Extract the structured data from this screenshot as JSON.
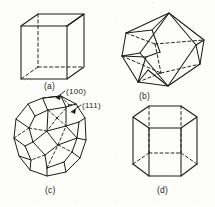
{
  "figure": {
    "background_color": "#fdfdfb",
    "line_color": "#1b1b1b",
    "style": "scanned textbook line art, solid visible edges, dashed hidden edges"
  },
  "captions": {
    "a": "(a)",
    "b": "(b)",
    "c": "(c)",
    "d": "(d)"
  },
  "face_labels": {
    "hundred": "(100)",
    "eleven_one": "(111)"
  },
  "shapes": [
    {
      "id": "a",
      "name": "cube",
      "caption": "(a)",
      "visible_edges": 9,
      "hidden_edges": 3,
      "hidden_vertices": 1
    },
    {
      "id": "b",
      "name": "rhombic-dodecahedron",
      "caption": "(b)",
      "visible_edges": 18,
      "hidden_edges": 6
    },
    {
      "id": "c",
      "name": "truncated-octahedron",
      "caption": "(c)",
      "labels": [
        "(100)",
        "(111)"
      ],
      "visible_edges": 24,
      "hidden_edges": 12
    },
    {
      "id": "d",
      "name": "hexagonal-prism",
      "caption": "(d)",
      "visible_edges": 12,
      "hidden_edges": 6
    }
  ]
}
